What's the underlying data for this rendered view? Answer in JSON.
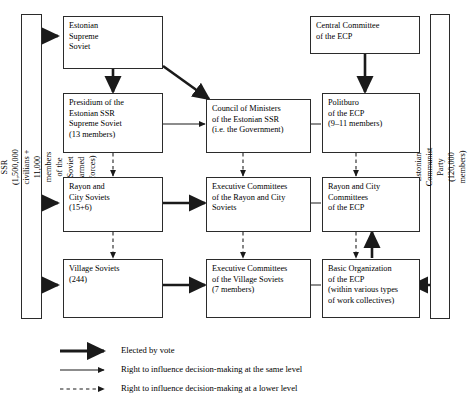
{
  "diagram": {
    "side_labels": {
      "left": "Citizens of the Estonian SSR\n(1,500,000 civilians + 11,000 members of the Soviet armed forces)",
      "right": "Estonian Communist Party (120,000  members)"
    },
    "nodes": [
      {
        "id": "estonian-supreme-soviet",
        "label": "Estonian\nSupreme\nSoviet"
      },
      {
        "id": "central-committee-ecp",
        "label": "Central Committee\nof the ECP"
      },
      {
        "id": "presidium",
        "label": "Presidium of the\nEstonian SSR\nSupreme Soviet\n(13 members)"
      },
      {
        "id": "council-of-ministers",
        "label": "Council of Ministers\nof the Estonian SSR\n(i.e. the Government)"
      },
      {
        "id": "politburo",
        "label": "Politburo\nof the ECP\n(9–11 members)"
      },
      {
        "id": "rayon-city-soviets",
        "label": "Rayon and\nCity Soviets\n(15+6)"
      },
      {
        "id": "exec-committees-rayon",
        "label": "Executive Committees\nof the Rayon and City\nSoviets"
      },
      {
        "id": "rayon-city-committees-ecp",
        "label": "Rayon and City\nCommittees\nof the ECP"
      },
      {
        "id": "village-soviets",
        "label": "Village Soviets\n(244)"
      },
      {
        "id": "exec-committees-village",
        "label": "Executive Committees\nof the Village Soviets\n(7 members)"
      },
      {
        "id": "basic-organization-ecp",
        "label": "Basic Organization\nof the ECP\n(within various types\nof work collectives)"
      }
    ],
    "legend": [
      {
        "id": "elected-by-vote",
        "style": "thick",
        "label": "Elected by vote"
      },
      {
        "id": "same-level",
        "style": "thin",
        "label": "Right to influence decision-making at the same level"
      },
      {
        "id": "lower-level",
        "style": "dashed",
        "label": "Right to influence decision-making at a lower level"
      }
    ],
    "colors": {
      "line": "#2b2b2b",
      "background": "#ffffff",
      "text": "#000000"
    }
  }
}
